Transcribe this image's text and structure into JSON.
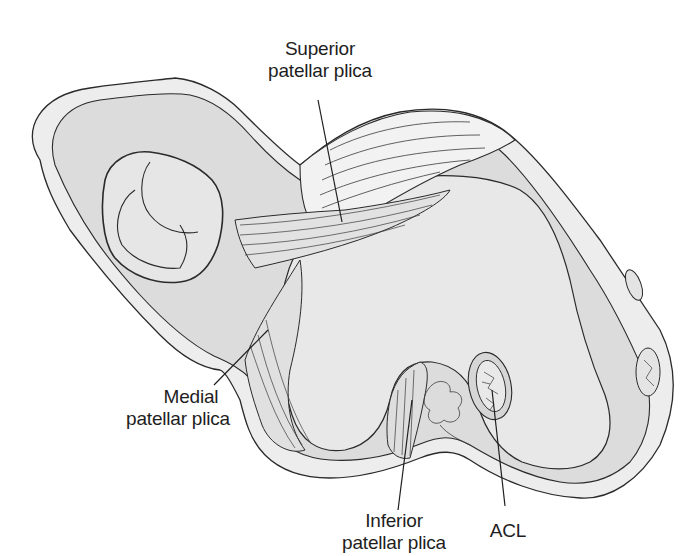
{
  "figure": {
    "colors": {
      "background": "#ffffff",
      "outer_fill": "#ededed",
      "inner_fill": "#dcdcdc",
      "bone_fill": "#e6e6e6",
      "shadow_fill": "#cfcfcf",
      "stroke": "#2a2a2a"
    }
  },
  "labels": {
    "superior": {
      "line1": "Superior",
      "line2": "patellar plica"
    },
    "medial": {
      "line1": "Medial",
      "line2": "patellar plica"
    },
    "inferior": {
      "line1": "Inferior",
      "line2": "patellar plica"
    },
    "acl": {
      "line1": "ACL"
    }
  }
}
